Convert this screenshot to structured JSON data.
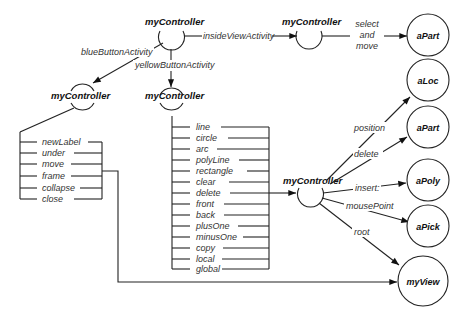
{
  "controllers": {
    "top": "myController",
    "inside": "myController",
    "blue": "myController",
    "yellow": "myController",
    "editor": "myController"
  },
  "edges": {
    "inside_view": "insideViewActivity",
    "blue_button": "blueButtonActivity",
    "yellow_button": "yellowButtonActivity",
    "select_move": [
      "select",
      "and",
      "move"
    ],
    "position": "position",
    "delete": "delete",
    "insert": "insert:",
    "mouse_point": "mousePoint",
    "root": "root"
  },
  "objects": {
    "aPart_top": "aPart",
    "aLoc": "aLoc",
    "aPart_mid": "aPart",
    "aPoly": "aPoly",
    "aPick": "aPick",
    "myView": "myView"
  },
  "blue_menu": [
    "newLabel",
    "under",
    "move",
    "frame",
    "collapse",
    "close"
  ],
  "yellow_menu": [
    "line",
    "circle",
    "arc",
    "polyLine",
    "rectangle",
    "clear",
    "delete",
    "front",
    "back",
    "plusOne",
    "minusOne",
    "copy",
    "local",
    "global"
  ]
}
